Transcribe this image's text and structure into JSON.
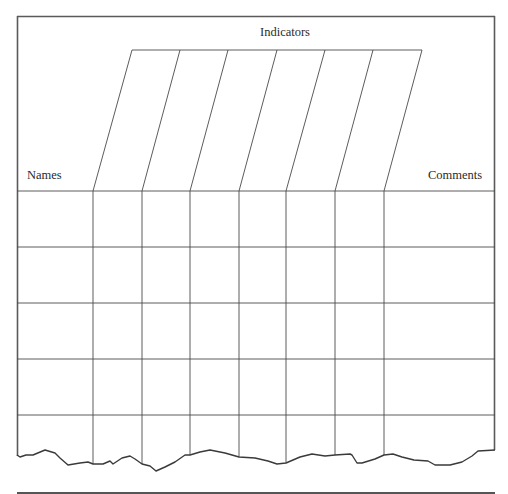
{
  "form": {
    "header": {
      "indicators_label": "Indicators",
      "names_label": "Names",
      "comments_label": "Comments"
    },
    "indicator_columns": 7,
    "rows": 5,
    "colors": {
      "border": "#555555",
      "grid": "#4a4a4a",
      "text": "#2a2a2a",
      "background": "#ffffff"
    }
  }
}
